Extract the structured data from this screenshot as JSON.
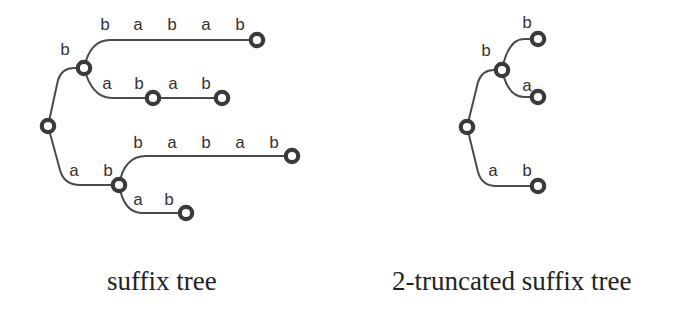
{
  "diagram": {
    "left": {
      "caption": "suffix tree",
      "labels": {
        "root_b": "b",
        "top_path": [
          "b",
          "a",
          "b",
          "a",
          "b"
        ],
        "mid_path_1": [
          "a",
          "b"
        ],
        "mid_path_2": [
          "a",
          "b"
        ],
        "root_ab": [
          "a",
          "b"
        ],
        "low_top_path": [
          "b",
          "a",
          "b",
          "a",
          "b"
        ],
        "low_bottom_path": [
          "a",
          "b"
        ]
      }
    },
    "right": {
      "caption": "2-truncated suffix tree",
      "labels": {
        "root_b": "b",
        "leaf_b": "b",
        "leaf_a": "a",
        "root_ab": [
          "a",
          "b"
        ]
      }
    }
  }
}
